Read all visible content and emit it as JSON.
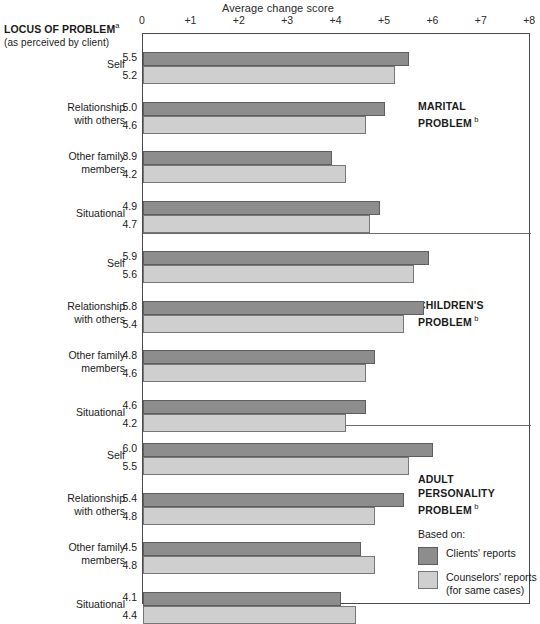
{
  "header": {
    "axis_title": "Average change score",
    "locus_title": "LOCUS OF PROBLEM",
    "locus_title_sup": "a",
    "locus_subtitle": "(as perceived by client)"
  },
  "axis": {
    "ticks": [
      "0",
      "+1",
      "+2",
      "+3",
      "+4",
      "+5",
      "+6",
      "+7",
      "+8"
    ]
  },
  "legend": {
    "based_on": "Based on:",
    "clients_label": "Clients' reports",
    "counselors_label": "Counselors' reports",
    "counselors_sub": "(for same cases)",
    "clients_color": "#8d8d8d",
    "counselors_color": "#cfcfcf"
  },
  "panels": [
    {
      "title_line1": "MARITAL",
      "title_line2": "PROBLEM",
      "title_sup": "b",
      "rows": [
        {
          "cat_line1": "Self",
          "cat_line2": "",
          "clients": "5.5",
          "counselors": "5.2"
        },
        {
          "cat_line1": "Relationship",
          "cat_line2": "with others",
          "clients": "5.0",
          "counselors": "4.6"
        },
        {
          "cat_line1": "Other family",
          "cat_line2": "members",
          "clients": "3.9",
          "counselors": "4.2"
        },
        {
          "cat_line1": "Situational",
          "cat_line2": "",
          "clients": "4.9",
          "counselors": "4.7"
        }
      ]
    },
    {
      "title_line1": "CHILDREN'S",
      "title_line2": "PROBLEM",
      "title_sup": "b",
      "rows": [
        {
          "cat_line1": "Self",
          "cat_line2": "",
          "clients": "5.9",
          "counselors": "5.6"
        },
        {
          "cat_line1": "Relationship",
          "cat_line2": "with others",
          "clients": "5.8",
          "counselors": "5.4"
        },
        {
          "cat_line1": "Other family",
          "cat_line2": "members",
          "clients": "4.8",
          "counselors": "4.6"
        },
        {
          "cat_line1": "Situational",
          "cat_line2": "",
          "clients": "4.6",
          "counselors": "4.2"
        }
      ]
    },
    {
      "title_line1": "ADULT",
      "title_line2": "PERSONALITY",
      "title_line3": "PROBLEM",
      "title_sup": "b",
      "rows": [
        {
          "cat_line1": "Self",
          "cat_line2": "",
          "clients": "6.0",
          "counselors": "5.5"
        },
        {
          "cat_line1": "Relationship",
          "cat_line2": "with others",
          "clients": "5.4",
          "counselors": "4.8"
        },
        {
          "cat_line1": "Other family",
          "cat_line2": "members",
          "clients": "4.5",
          "counselors": "4.8"
        },
        {
          "cat_line1": "Situational",
          "cat_line2": "",
          "clients": "4.1",
          "counselors": "4.4"
        }
      ]
    }
  ],
  "chart_data": {
    "type": "bar",
    "title": "Average change score",
    "xlabel": "Average change score",
    "ylabel": "LOCUS OF PROBLEM (as perceived by client)",
    "orientation": "horizontal",
    "xlim": [
      0,
      8
    ],
    "xticks": [
      0,
      1,
      2,
      3,
      4,
      5,
      6,
      7,
      8
    ],
    "xticklabels": [
      "0",
      "+1",
      "+2",
      "+3",
      "+4",
      "+5",
      "+6",
      "+7",
      "+8"
    ],
    "grid": false,
    "legend_position": "bottom-right",
    "legend": [
      "Clients' reports",
      "Counselors' reports (for same cases)"
    ],
    "groups": [
      {
        "name": "MARITAL PROBLEM",
        "categories": [
          "Self",
          "Relationship with others",
          "Other family members",
          "Situational"
        ],
        "series": [
          {
            "name": "Clients' reports",
            "values": [
              5.5,
              5.0,
              3.9,
              4.9
            ]
          },
          {
            "name": "Counselors' reports",
            "values": [
              5.2,
              4.6,
              4.2,
              4.7
            ]
          }
        ]
      },
      {
        "name": "CHILDREN'S PROBLEM",
        "categories": [
          "Self",
          "Relationship with others",
          "Other family members",
          "Situational"
        ],
        "series": [
          {
            "name": "Clients' reports",
            "values": [
              5.9,
              5.8,
              4.8,
              4.6
            ]
          },
          {
            "name": "Counselors' reports",
            "values": [
              5.6,
              5.4,
              4.6,
              4.2
            ]
          }
        ]
      },
      {
        "name": "ADULT PERSONALITY PROBLEM",
        "categories": [
          "Self",
          "Relationship with others",
          "Other family members",
          "Situational"
        ],
        "series": [
          {
            "name": "Clients' reports",
            "values": [
              6.0,
              5.4,
              4.5,
              4.1
            ]
          },
          {
            "name": "Counselors' reports",
            "values": [
              5.5,
              4.8,
              4.8,
              4.4
            ]
          }
        ]
      }
    ]
  }
}
